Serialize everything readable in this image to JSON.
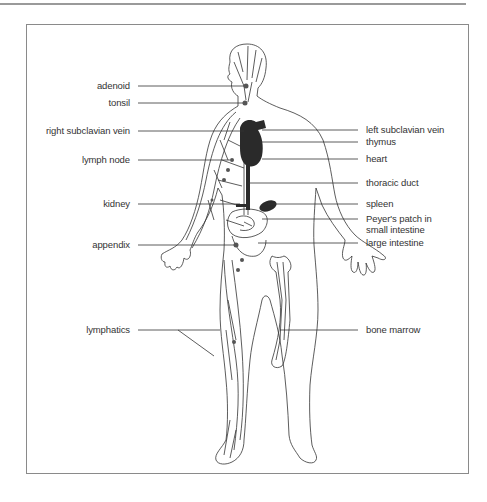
{
  "diagram": {
    "labels_left": [
      {
        "id": "adenoid",
        "text": "adenoid",
        "y": 86
      },
      {
        "id": "tonsil",
        "text": "tonsil",
        "y": 103
      },
      {
        "id": "right-subclavian-vein",
        "text": "right  subclavian vein",
        "y": 131
      },
      {
        "id": "lymph-node",
        "text": "lymph node",
        "y": 160
      },
      {
        "id": "kidney",
        "text": "kidney",
        "y": 204
      },
      {
        "id": "appendix",
        "text": "appendix",
        "y": 245
      },
      {
        "id": "lymphatics",
        "text": "lymphatics",
        "y": 330
      }
    ],
    "labels_right": [
      {
        "id": "left-subclavian-vein",
        "text": "left subclavian vein",
        "y": 130
      },
      {
        "id": "thymus",
        "text": "thymus",
        "y": 142
      },
      {
        "id": "heart",
        "text": "heart",
        "y": 159
      },
      {
        "id": "thoracic-duct",
        "text": "thoracic duct",
        "y": 183
      },
      {
        "id": "spleen",
        "text": "spleen",
        "y": 204
      },
      {
        "id": "peyers-patch",
        "text": "Peyer's patch in",
        "y": 219
      },
      {
        "id": "peyers-patch-2",
        "text": "small intestine",
        "y": 230
      },
      {
        "id": "large-intestine",
        "text": "large intestine",
        "y": 243
      },
      {
        "id": "bone-marrow",
        "text": "bone marrow",
        "y": 330
      }
    ],
    "colors": {
      "line": "#333333",
      "organ": "#2a2a2a",
      "frame": "#8a8a8a",
      "node": "#555555"
    }
  }
}
